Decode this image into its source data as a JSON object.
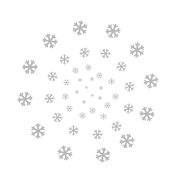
{
  "image": {
    "description": "Spiral arrangement of gray snowflakes on white background",
    "background": "#ffffff",
    "flake_color": "#b8b8b8"
  },
  "snowflakes": [
    {
      "x": 80,
      "y": 28,
      "size": 16,
      "rot": 10
    },
    {
      "x": 113,
      "y": 31,
      "size": 16,
      "rot": 25
    },
    {
      "x": 50,
      "y": 41,
      "size": 16,
      "rot": 40
    },
    {
      "x": 137,
      "y": 50,
      "size": 16,
      "rot": 5
    },
    {
      "x": 30,
      "y": 67,
      "size": 16,
      "rot": 30
    },
    {
      "x": 151,
      "y": 81,
      "size": 16,
      "rot": 15
    },
    {
      "x": 25,
      "y": 99,
      "size": 16,
      "rot": 20
    },
    {
      "x": 147,
      "y": 114,
      "size": 16,
      "rot": 35
    },
    {
      "x": 38,
      "y": 131,
      "size": 16,
      "rot": 0
    },
    {
      "x": 127,
      "y": 141,
      "size": 16,
      "rot": 20
    },
    {
      "x": 65,
      "y": 153,
      "size": 16,
      "rot": 45
    },
    {
      "x": 103,
      "y": 155,
      "size": 16,
      "rot": 10
    },
    {
      "x": 84,
      "y": 52,
      "size": 11,
      "rot": 15
    },
    {
      "x": 105,
      "y": 53,
      "size": 11,
      "rot": 30
    },
    {
      "x": 64,
      "y": 59,
      "size": 11,
      "rot": 0
    },
    {
      "x": 121,
      "y": 66,
      "size": 11,
      "rot": 20
    },
    {
      "x": 52,
      "y": 76,
      "size": 11,
      "rot": 40
    },
    {
      "x": 129,
      "y": 86,
      "size": 11,
      "rot": 10
    },
    {
      "x": 49,
      "y": 98,
      "size": 11,
      "rot": 25
    },
    {
      "x": 128,
      "y": 108,
      "size": 11,
      "rot": 5
    },
    {
      "x": 57,
      "y": 117,
      "size": 11,
      "rot": 35
    },
    {
      "x": 116,
      "y": 126,
      "size": 11,
      "rot": 15
    },
    {
      "x": 73,
      "y": 130,
      "size": 11,
      "rot": 0
    },
    {
      "x": 97,
      "y": 134,
      "size": 11,
      "rot": 30
    },
    {
      "x": 75,
      "y": 70,
      "size": 7,
      "rot": 10
    },
    {
      "x": 88,
      "y": 67,
      "size": 7,
      "rot": 40
    },
    {
      "x": 99,
      "y": 75,
      "size": 7,
      "rot": 20
    },
    {
      "x": 111,
      "y": 81,
      "size": 7,
      "rot": 0
    },
    {
      "x": 66,
      "y": 82,
      "size": 7,
      "rot": 30
    },
    {
      "x": 115,
      "y": 96,
      "size": 7,
      "rot": 15
    },
    {
      "x": 65,
      "y": 96,
      "size": 7,
      "rot": 5
    },
    {
      "x": 107,
      "y": 105,
      "size": 7,
      "rot": 25
    },
    {
      "x": 69,
      "y": 108,
      "size": 7,
      "rot": 35
    },
    {
      "x": 92,
      "y": 110,
      "size": 7,
      "rot": 10
    },
    {
      "x": 82,
      "y": 115,
      "size": 7,
      "rot": 45
    },
    {
      "x": 103,
      "y": 116,
      "size": 7,
      "rot": 0
    },
    {
      "x": 80,
      "y": 80,
      "size": 4,
      "rot": 0
    },
    {
      "x": 92,
      "y": 79,
      "size": 4,
      "rot": 20
    },
    {
      "x": 101,
      "y": 88,
      "size": 4,
      "rot": 10
    },
    {
      "x": 77,
      "y": 92,
      "size": 4,
      "rot": 30
    },
    {
      "x": 100,
      "y": 98,
      "size": 4,
      "rot": 0
    },
    {
      "x": 84,
      "y": 102,
      "size": 4,
      "rot": 15
    },
    {
      "x": 92,
      "y": 95,
      "size": 3,
      "rot": 0
    },
    {
      "x": 86,
      "y": 87,
      "size": 3,
      "rot": 0
    }
  ]
}
